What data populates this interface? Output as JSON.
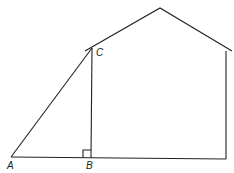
{
  "diagram": {
    "type": "geometry",
    "points": {
      "A": {
        "label": "A",
        "x": 11,
        "y": 157
      },
      "B": {
        "label": "B",
        "x": 91,
        "y": 158
      },
      "C": {
        "label": "C",
        "x": 92,
        "y": 48
      }
    },
    "labels": {
      "A": "A",
      "B": "B",
      "C": "C"
    },
    "right_angle_at": "B",
    "stroke_color": "#222222"
  }
}
